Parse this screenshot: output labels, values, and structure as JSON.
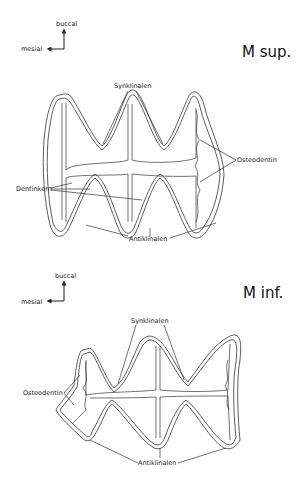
{
  "panels": [
    {
      "title": "M sup.",
      "orientation": {
        "up": "buccal",
        "left": "mesial"
      },
      "labels": {
        "synklinalen": "Synklinalen",
        "antiklinalen": "Antiklinalen",
        "osteodentin": "Osteodentin",
        "dentinkern": "Dentinkern"
      }
    },
    {
      "title": "M inf.",
      "orientation": {
        "up": "buccal",
        "left": "mesial"
      },
      "labels": {
        "synklinalen": "Synklinalen",
        "antiklinalen": "Antiklinalen",
        "osteodentin": "Osteodentin"
      }
    }
  ],
  "colors": {
    "line": "#333333",
    "background": "#ffffff"
  }
}
